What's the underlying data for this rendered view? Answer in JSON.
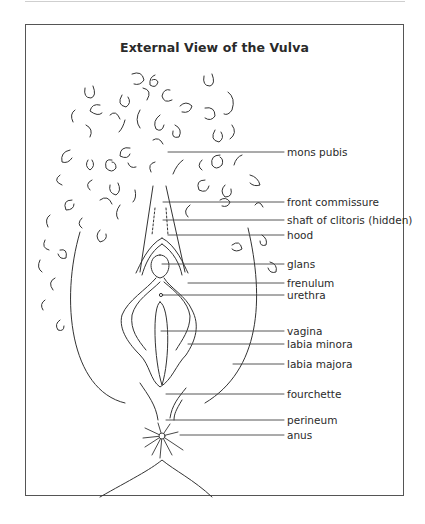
{
  "figure": {
    "title": "External View of the Vulva",
    "labels": [
      {
        "id": "mons-pubis",
        "text": "mons pubis",
        "y": 146
      },
      {
        "id": "front-commissure",
        "text": "front commissure",
        "y": 196
      },
      {
        "id": "shaft-of-clitoris",
        "text": "shaft of clitoris (hidden)",
        "y": 214
      },
      {
        "id": "hood",
        "text": "hood",
        "y": 229
      },
      {
        "id": "glans",
        "text": "glans",
        "y": 258
      },
      {
        "id": "frenulum",
        "text": "frenulum",
        "y": 277
      },
      {
        "id": "urethra",
        "text": "urethra",
        "y": 289
      },
      {
        "id": "vagina",
        "text": "vagina",
        "y": 329
      },
      {
        "id": "labia-minora",
        "text": "labia minora",
        "y": 342
      },
      {
        "id": "labia-majora",
        "text": "labia majora",
        "y": 363
      },
      {
        "id": "fourchette",
        "text": "fourchette",
        "y": 391
      },
      {
        "id": "perineum",
        "text": "perineum",
        "y": 418
      },
      {
        "id": "anus",
        "text": "anus",
        "y": 433
      }
    ]
  }
}
